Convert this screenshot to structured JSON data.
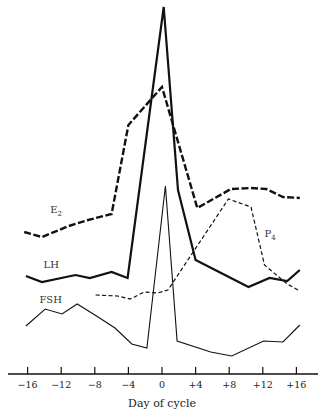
{
  "chart_data": {
    "type": "line",
    "title": "",
    "xlabel": "Day of cycle",
    "ylabel": "",
    "x_ticks": [
      -16,
      -12,
      -8,
      -4,
      0,
      4,
      8,
      12,
      16
    ],
    "x_tick_labels": [
      "−16",
      "−12",
      "−8",
      "−4",
      "0",
      "+4",
      "+8",
      "+12",
      "+16"
    ],
    "xlim": [
      -18,
      18
    ],
    "y_axis_shown": false,
    "y_units": "relative height above x-axis (arbitrary units, no y scale shown)",
    "grid": false,
    "legend": "inline labels",
    "series": [
      {
        "name": "E2",
        "label": "E",
        "subscript": "2",
        "style": "heavy-dashed",
        "label_pos": {
          "x": -13.3,
          "y": 161
        },
        "points": [
          {
            "x": -16.4,
            "y": 142
          },
          {
            "x": -14.3,
            "y": 137
          },
          {
            "x": -11.1,
            "y": 148
          },
          {
            "x": -8.8,
            "y": 154
          },
          {
            "x": -6.0,
            "y": 160
          },
          {
            "x": -4.0,
            "y": 249
          },
          {
            "x": 0.0,
            "y": 287
          },
          {
            "x": 4.2,
            "y": 166
          },
          {
            "x": 8.2,
            "y": 185
          },
          {
            "x": 10.6,
            "y": 186
          },
          {
            "x": 12.4,
            "y": 185
          },
          {
            "x": 14.4,
            "y": 177
          },
          {
            "x": 16.4,
            "y": 176
          }
        ]
      },
      {
        "name": "LH",
        "label": "LH",
        "subscript": "",
        "style": "heavy-solid",
        "label_pos": {
          "x": -14.1,
          "y": 106
        },
        "points": [
          {
            "x": -16.2,
            "y": 98
          },
          {
            "x": -14.3,
            "y": 92
          },
          {
            "x": -10.3,
            "y": 99
          },
          {
            "x": -8.6,
            "y": 96
          },
          {
            "x": -6.0,
            "y": 102
          },
          {
            "x": -4.1,
            "y": 96
          },
          {
            "x": 0.2,
            "y": 367
          },
          {
            "x": 1.9,
            "y": 184
          },
          {
            "x": 4.0,
            "y": 114
          },
          {
            "x": 10.3,
            "y": 87
          },
          {
            "x": 12.8,
            "y": 96
          },
          {
            "x": 14.9,
            "y": 93
          },
          {
            "x": 16.4,
            "y": 104
          }
        ]
      },
      {
        "name": "P4",
        "label": "P",
        "subscript": "4",
        "style": "light-dashed",
        "label_pos": {
          "x": 12.2,
          "y": 137
        },
        "points": [
          {
            "x": -7.9,
            "y": 79
          },
          {
            "x": -5.3,
            "y": 78
          },
          {
            "x": -3.8,
            "y": 75
          },
          {
            "x": -2.1,
            "y": 82
          },
          {
            "x": -0.5,
            "y": 81
          },
          {
            "x": 0.7,
            "y": 84
          },
          {
            "x": 7.9,
            "y": 175
          },
          {
            "x": 10.6,
            "y": 167
          },
          {
            "x": 12.2,
            "y": 109
          },
          {
            "x": 14.9,
            "y": 90
          },
          {
            "x": 16.4,
            "y": 83
          }
        ]
      },
      {
        "name": "FSH",
        "label": "FSH",
        "subscript": "",
        "style": "light-solid",
        "label_pos": {
          "x": -14.6,
          "y": 71
        },
        "points": [
          {
            "x": -16.2,
            "y": 48
          },
          {
            "x": -13.9,
            "y": 65
          },
          {
            "x": -11.9,
            "y": 60
          },
          {
            "x": -10.1,
            "y": 70
          },
          {
            "x": -7.8,
            "y": 58
          },
          {
            "x": -5.6,
            "y": 46
          },
          {
            "x": -3.6,
            "y": 30
          },
          {
            "x": -1.8,
            "y": 26
          },
          {
            "x": 0.4,
            "y": 188
          },
          {
            "x": 1.8,
            "y": 33
          },
          {
            "x": 5.8,
            "y": 22
          },
          {
            "x": 8.3,
            "y": 18
          },
          {
            "x": 12.1,
            "y": 33
          },
          {
            "x": 14.4,
            "y": 32
          },
          {
            "x": 16.4,
            "y": 49
          }
        ]
      }
    ]
  }
}
